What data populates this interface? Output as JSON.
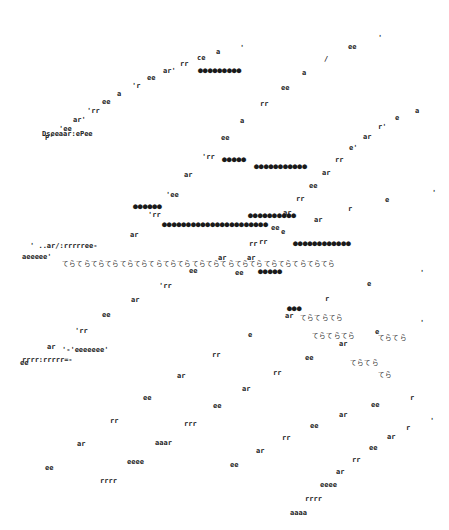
{
  "artwork": {
    "description": "Typewriter concrete-poetry style composition of diagonal character curves",
    "ink_color": "#222222",
    "background": "#ffffff",
    "curves": [
      {
        "id": "c1",
        "glyphs": [
          "'",
          "a",
          "ce",
          "rr",
          "ar'",
          "ee",
          "'r",
          "a",
          "ee",
          "'rr",
          "ar'",
          "'ee",
          "P'"
        ],
        "tail": "Dreeaar:ePee",
        "x0": 240,
        "y0": 45,
        "x1": 45,
        "y1": 135
      },
      {
        "id": "c2",
        "glyphs": [
          "'",
          "ee",
          "/",
          "a",
          "ee",
          "rr",
          "a",
          "ee",
          "'rr",
          "ar",
          "'ee",
          "'rr",
          "ar"
        ],
        "x0": 378,
        "y0": 35,
        "x1": 130,
        "y1": 232
      },
      {
        "id": "c3",
        "glyphs": [
          "a",
          "e",
          "r'",
          "ar",
          "e'",
          "rr",
          "ar",
          "ee",
          "rr",
          "ar",
          "ee",
          "rr",
          "ar",
          "ee"
        ],
        "x0": 415,
        "y0": 108,
        "x1": 235,
        "y1": 270
      },
      {
        "id": "c4",
        "glyphs": [
          "'",
          "e",
          "r",
          "ar",
          "e",
          "rr",
          "ar",
          "ee",
          "'rr",
          "ar",
          "ee",
          "'rr",
          "ar",
          "ee"
        ],
        "x0": 432,
        "y0": 190,
        "x1": 20,
        "y1": 360
      },
      {
        "id": "c5",
        "glyphs": [
          "'",
          "e",
          "r",
          "ar",
          "e",
          "rr",
          "ar",
          "ee",
          "rr",
          "ar",
          "ee"
        ],
        "x0": 420,
        "y0": 270,
        "x1": 45,
        "y1": 465
      },
      {
        "id": "c6",
        "glyphs": [
          "'",
          "e",
          "ar",
          "ee",
          "rr",
          "ar",
          "ee",
          "rrr",
          "aaar",
          "eeee",
          "rrrr"
        ],
        "x0": 420,
        "y0": 320,
        "x1": 100,
        "y1": 478
      },
      {
        "id": "c7",
        "glyphs": [
          "r",
          "ee",
          "ar",
          "ee",
          "rr",
          "ar",
          "ee"
        ],
        "x0": 410,
        "y0": 395,
        "x1": 230,
        "y1": 462
      },
      {
        "id": "c8",
        "glyphs": [
          "'",
          "r",
          "ar",
          "ee",
          "rr",
          "ar",
          "eeee",
          "rrrr",
          "aaaa"
        ],
        "x0": 430,
        "y0": 418,
        "x1": 290,
        "y1": 510
      }
    ],
    "dot_runs": [
      {
        "id": "d1",
        "text": "●●●●●●●●●",
        "x": 198,
        "y": 67
      },
      {
        "id": "d2",
        "text": "●●●●●",
        "x": 222,
        "y": 156
      },
      {
        "id": "d3",
        "text": "●●●●●●●●●●●",
        "x": 254,
        "y": 163
      },
      {
        "id": "d4",
        "text": "●●●●●●",
        "x": 133,
        "y": 203
      },
      {
        "id": "d5",
        "text": "●●●●●●●●●●●●●●●●●●●●●●",
        "x": 162,
        "y": 221
      },
      {
        "id": "d6",
        "text": "●●●●●●●●●●",
        "x": 248,
        "y": 212
      },
      {
        "id": "d7",
        "text": "●●●●●●●●●●●●",
        "x": 293,
        "y": 240
      },
      {
        "id": "d8",
        "text": "●●●●●",
        "x": 258,
        "y": 268
      },
      {
        "id": "d9",
        "text": "●●●",
        "x": 287,
        "y": 305
      }
    ],
    "tera_runs": [
      {
        "id": "t1",
        "text": "てらてらてらてらてらてらてらてらてらてらてらてらてらてらてらてらてらてらてら",
        "x": 62,
        "y": 261
      },
      {
        "id": "t2",
        "text": "てらてらてら",
        "x": 300,
        "y": 315
      },
      {
        "id": "t3",
        "text": "てらてらてら",
        "x": 312,
        "y": 333
      },
      {
        "id": "t4",
        "text": "てらてら",
        "x": 378,
        "y": 335
      },
      {
        "id": "t5",
        "text": "てらてら",
        "x": 350,
        "y": 360
      },
      {
        "id": "t6",
        "text": "てら",
        "x": 378,
        "y": 372
      }
    ],
    "left_tails": [
      {
        "id": "l1",
        "text": "Dseeaar:ePee",
        "x": 42,
        "y": 131
      },
      {
        "id": "l2",
        "text": "' ..ar/:rrrrree-",
        "x": 30,
        "y": 243
      },
      {
        "id": "l3",
        "text": "aeeeee'",
        "x": 22,
        "y": 254
      },
      {
        "id": "l4",
        "text": "rrrr:rrrrr=-",
        "x": 22,
        "y": 357
      },
      {
        "id": "l5",
        "text": "'-'eeeeeee'",
        "x": 62,
        "y": 347
      }
    ]
  }
}
